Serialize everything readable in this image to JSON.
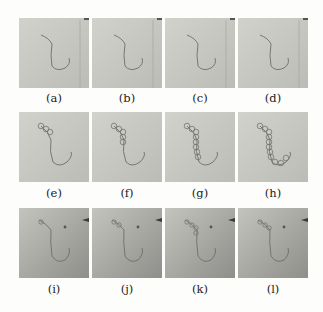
{
  "figure": {
    "panels": [
      {
        "id": "a",
        "label": "(a)",
        "row": 0,
        "col": 0,
        "content": "catheter-only",
        "beads": 0
      },
      {
        "id": "b",
        "label": "(b)",
        "row": 0,
        "col": 1,
        "content": "catheter-only",
        "beads": 0
      },
      {
        "id": "c",
        "label": "(c)",
        "row": 0,
        "col": 2,
        "content": "catheter-only",
        "beads": 0
      },
      {
        "id": "d",
        "label": "(d)",
        "row": 0,
        "col": 3,
        "content": "catheter-only",
        "beads": 0
      },
      {
        "id": "e",
        "label": "(e)",
        "row": 1,
        "col": 0,
        "content": "catheter-with-circles",
        "beads": 3
      },
      {
        "id": "f",
        "label": "(f)",
        "row": 1,
        "col": 1,
        "content": "catheter-with-circles",
        "beads": 5
      },
      {
        "id": "g",
        "label": "(g)",
        "row": 1,
        "col": 2,
        "content": "catheter-with-circles",
        "beads": 8
      },
      {
        "id": "h",
        "label": "(h)",
        "row": 1,
        "col": 3,
        "content": "catheter-with-circles",
        "beads": 11
      },
      {
        "id": "i",
        "label": "(i)",
        "row": 2,
        "col": 0,
        "content": "catheter-dark-background",
        "beads": 1
      },
      {
        "id": "j",
        "label": "(j)",
        "row": 2,
        "col": 1,
        "content": "catheter-dark-background",
        "beads": 2
      },
      {
        "id": "k",
        "label": "(k)",
        "row": 2,
        "col": 2,
        "content": "catheter-dark-background",
        "beads": 4
      },
      {
        "id": "l",
        "label": "(l)",
        "row": 2,
        "col": 3,
        "content": "catheter-dark-background",
        "beads": 3
      }
    ],
    "colors": {
      "row1_bg": "#c9c9c4",
      "row2_bg": "#c2c2bd",
      "row3_bg": "#a9a9a4",
      "curve": "#6e6e6a",
      "label_text": "#222222"
    }
  }
}
